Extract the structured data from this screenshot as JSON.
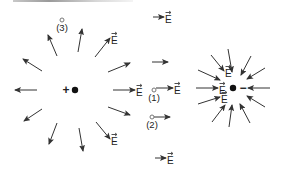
{
  "figure": {
    "positive_charge": {
      "symbol": "+",
      "x": 75,
      "y": 90
    },
    "negative_charge": {
      "symbol": "−",
      "x": 233,
      "y": 88
    },
    "field_label": "E",
    "points": [
      {
        "label": "(1)",
        "x": 154,
        "y": 90
      },
      {
        "label": "(2)",
        "x": 152,
        "y": 117
      },
      {
        "label": "(3)",
        "x": 62,
        "y": 20
      }
    ],
    "colors": {
      "arrow": "#333333",
      "charge": "#111111",
      "text": "#222222",
      "point": "#777777"
    }
  },
  "positive_field_arrows": [
    {
      "x1": 37,
      "y1": 90,
      "x2": 15,
      "y2": 90,
      "label": ""
    },
    {
      "x1": 42,
      "y1": 71,
      "x2": 23,
      "y2": 59,
      "label": ""
    },
    {
      "x1": 57,
      "y1": 56,
      "x2": 48,
      "y2": 35,
      "label": ""
    },
    {
      "x1": 78,
      "y1": 52,
      "x2": 82,
      "y2": 29,
      "label": ""
    },
    {
      "x1": 95,
      "y1": 57,
      "x2": 110,
      "y2": 38,
      "label": "E"
    },
    {
      "x1": 108,
      "y1": 72,
      "x2": 130,
      "y2": 63,
      "label": ""
    },
    {
      "x1": 113,
      "y1": 90,
      "x2": 135,
      "y2": 90,
      "label": "E"
    },
    {
      "x1": 108,
      "y1": 107,
      "x2": 130,
      "y2": 115,
      "label": ""
    },
    {
      "x1": 96,
      "y1": 122,
      "x2": 110,
      "y2": 139,
      "label": "E"
    },
    {
      "x1": 79,
      "y1": 128,
      "x2": 83,
      "y2": 151,
      "label": ""
    },
    {
      "x1": 57,
      "y1": 123,
      "x2": 49,
      "y2": 144,
      "label": ""
    },
    {
      "x1": 42,
      "y1": 109,
      "x2": 24,
      "y2": 121,
      "label": ""
    }
  ],
  "negative_field_arrows": [
    {
      "x1": 270,
      "y1": 88,
      "x2": 248,
      "y2": 88,
      "label": ""
    },
    {
      "x1": 265,
      "y1": 68,
      "x2": 247,
      "y2": 79,
      "label": ""
    },
    {
      "x1": 251,
      "y1": 56,
      "x2": 241,
      "y2": 75,
      "label": ""
    },
    {
      "x1": 228,
      "y1": 49,
      "x2": 232,
      "y2": 72,
      "label": ""
    },
    {
      "x1": 211,
      "y1": 55,
      "x2": 224,
      "y2": 71,
      "label": "E"
    },
    {
      "x1": 198,
      "y1": 70,
      "x2": 220,
      "y2": 80,
      "label": ""
    },
    {
      "x1": 196,
      "y1": 88,
      "x2": 218,
      "y2": 88,
      "label": "E"
    },
    {
      "x1": 198,
      "y1": 104,
      "x2": 220,
      "y2": 97,
      "label": "E"
    },
    {
      "x1": 212,
      "y1": 122,
      "x2": 225,
      "y2": 105,
      "label": ""
    },
    {
      "x1": 229,
      "y1": 127,
      "x2": 232,
      "y2": 105,
      "label": ""
    },
    {
      "x1": 250,
      "y1": 123,
      "x2": 240,
      "y2": 104,
      "label": ""
    },
    {
      "x1": 265,
      "y1": 107,
      "x2": 247,
      "y2": 96,
      "label": ""
    }
  ],
  "free_arrows": [
    {
      "x1": 153,
      "y1": 17,
      "x2": 164,
      "y2": 17,
      "label": "E"
    },
    {
      "x1": 152,
      "y1": 62,
      "x2": 168,
      "y2": 62,
      "label": ""
    },
    {
      "x1": 156,
      "y1": 88,
      "x2": 173,
      "y2": 88,
      "label": "E"
    },
    {
      "x1": 154,
      "y1": 117,
      "x2": 170,
      "y2": 117,
      "label": ""
    },
    {
      "x1": 155,
      "y1": 158,
      "x2": 166,
      "y2": 158,
      "label": "E"
    }
  ]
}
